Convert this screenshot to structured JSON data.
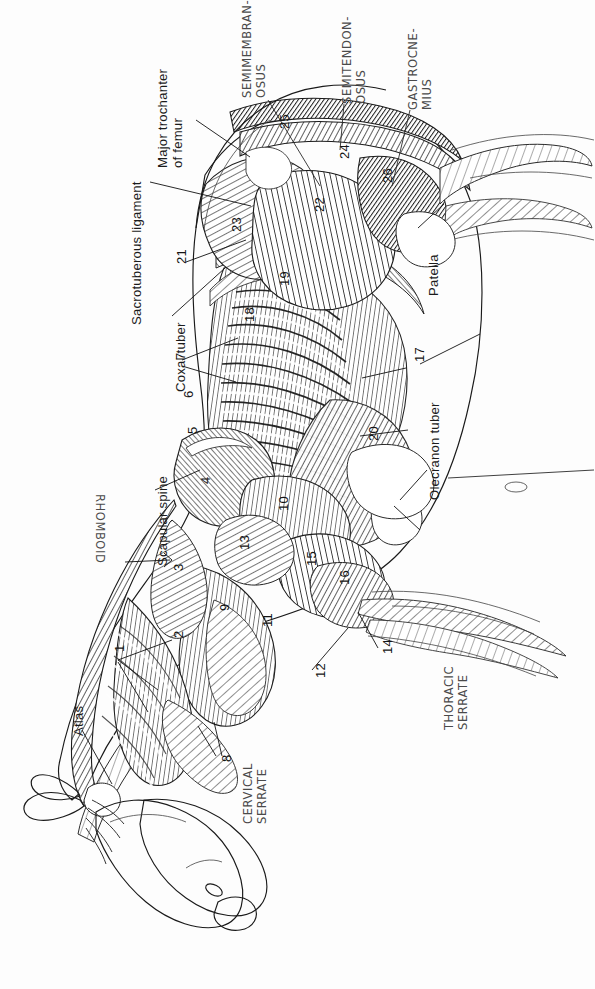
{
  "document": {
    "type": "anatomical-illustration",
    "subject": "Superficial muscles of the ox (bovine) — left lateral view",
    "orientation": "page rotated 90 degrees; animal faces lower-left",
    "background_color": "#fdfdfd",
    "ink_color": "#1b1b1b",
    "handwriting_color": "#4a4a4a"
  },
  "printed_labels": [
    {
      "id": "major-trochanter",
      "text": "Major trochanter\nof femur"
    },
    {
      "id": "sacrotuberous-ligament",
      "text": "Sacrotuberous ligament"
    },
    {
      "id": "coxal-tuber",
      "text": "Coxal tuber"
    },
    {
      "id": "scapular-spine",
      "text": "Scapular spine"
    },
    {
      "id": "atlas",
      "text": "Atlas"
    },
    {
      "id": "patella",
      "text": "Patella"
    },
    {
      "id": "olecranon-tuber",
      "text": "Olecranon tuber"
    }
  ],
  "handwritten_labels": [
    {
      "id": "semimembranosus",
      "text": "SEMIMEMBRAN-\nOSUS"
    },
    {
      "id": "semitendinosus",
      "text": "SEMITENDON-\nOSUS"
    },
    {
      "id": "gastrocnemius",
      "text": "GASTROCNE-\nMIUS"
    },
    {
      "id": "rhomboid",
      "text": "RHOMBOID"
    },
    {
      "id": "cervical-serrate",
      "text": "CERVICAL\nSERRATE"
    },
    {
      "id": "thoracic-serrate",
      "text": "THORACIC\nSERRATE"
    }
  ],
  "numbered_keys": [
    {
      "n": "1",
      "x": 113,
      "y": 652
    },
    {
      "n": "2",
      "x": 172,
      "y": 638
    },
    {
      "n": "3",
      "x": 172,
      "y": 571
    },
    {
      "n": "4",
      "x": 199,
      "y": 484
    },
    {
      "n": "5",
      "x": 186,
      "y": 434
    },
    {
      "n": "6",
      "x": 182,
      "y": 398
    },
    {
      "n": "7",
      "x": 174,
      "y": 360
    },
    {
      "n": "8",
      "x": 220,
      "y": 762
    },
    {
      "n": "9",
      "x": 218,
      "y": 611
    },
    {
      "n": "10",
      "x": 277,
      "y": 511
    },
    {
      "n": "11",
      "x": 261,
      "y": 627
    },
    {
      "n": "12",
      "x": 314,
      "y": 678
    },
    {
      "n": "13",
      "x": 238,
      "y": 550
    },
    {
      "n": "14",
      "x": 381,
      "y": 654
    },
    {
      "n": "15",
      "x": 305,
      "y": 566
    },
    {
      "n": "16",
      "x": 338,
      "y": 585
    },
    {
      "n": "17",
      "x": 413,
      "y": 362
    },
    {
      "n": "18",
      "x": 243,
      "y": 322
    },
    {
      "n": "19",
      "x": 278,
      "y": 286
    },
    {
      "n": "20",
      "x": 367,
      "y": 441
    },
    {
      "n": "21",
      "x": 175,
      "y": 264
    },
    {
      "n": "22",
      "x": 313,
      "y": 212
    },
    {
      "n": "23",
      "x": 230,
      "y": 232
    },
    {
      "n": "24",
      "x": 338,
      "y": 159
    },
    {
      "n": "25",
      "x": 278,
      "y": 129
    },
    {
      "n": "26",
      "x": 381,
      "y": 183
    }
  ]
}
